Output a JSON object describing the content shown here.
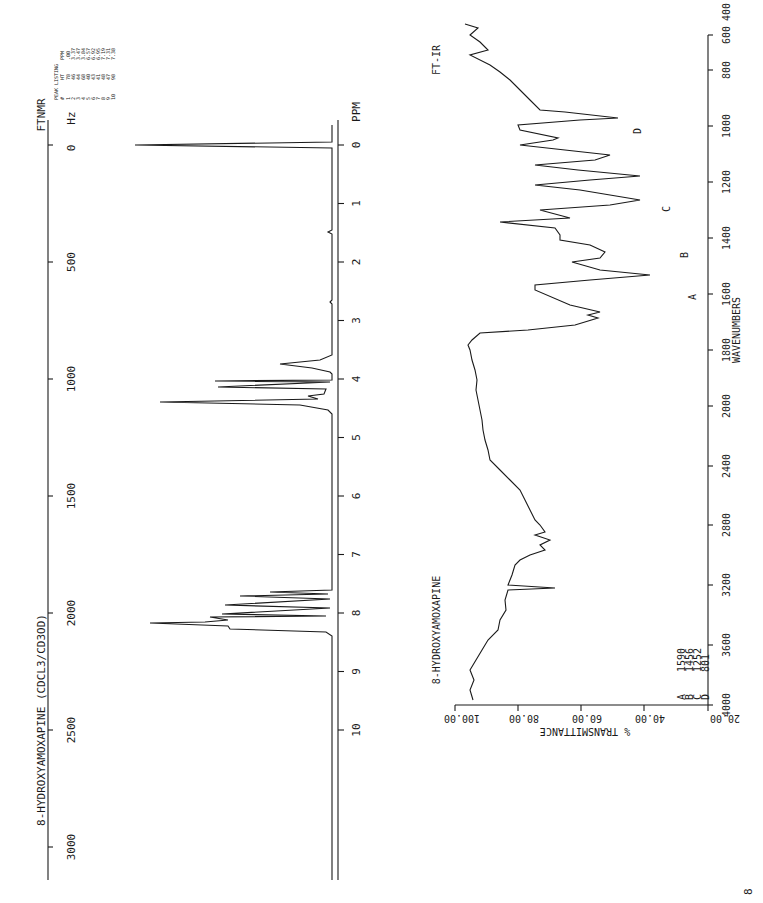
{
  "nmr": {
    "title": "8-HYDROXYAMOXAPINE (CDCL3/CD3OD)",
    "instrument": "FTNMR",
    "hz_unit": "Hz",
    "ppm_unit": "PPM",
    "hz_ticks": [
      "0",
      "500",
      "1000",
      "1500",
      "2000",
      "2500",
      "3000"
    ],
    "ppm_ticks": [
      "0",
      "1",
      "2",
      "3",
      "4",
      "5",
      "6",
      "7",
      "8",
      "9",
      "10"
    ],
    "peak_listing": {
      "title": "PEAK LISTING",
      "headers": [
        "#",
        "HT",
        "PPM"
      ],
      "rows": [
        [
          "1",
          "78",
          ".00"
        ],
        [
          "2",
          "46",
          "3.37"
        ],
        [
          "3",
          "44",
          "3.47"
        ],
        [
          "4",
          "68",
          "3.84"
        ],
        [
          "5",
          "40",
          "6.57"
        ],
        [
          "6",
          "43",
          "6.92"
        ],
        [
          "7",
          "41",
          "6.95"
        ],
        [
          "8",
          "48",
          "7.19"
        ],
        [
          "9",
          "47",
          "7.31"
        ],
        [
          "10",
          "98",
          "7.38"
        ]
      ]
    }
  },
  "ir": {
    "title": "8-HYDROXYAMOXAPINE",
    "instrument": "FT-IR",
    "x_label": "WAVENUMBERS",
    "y_label": "% TRANSMITTANCE",
    "x_ticks": [
      "4000",
      "3600",
      "3200",
      "2800",
      "2400",
      "2000",
      "1800",
      "1600",
      "1400",
      "1200",
      "1000",
      "800",
      "600",
      "400"
    ],
    "y_ticks": [
      "20.00",
      "40.00",
      "60.00",
      "80.00",
      "100.00"
    ],
    "peaks": [
      {
        "label": "A",
        "wavenumber": "1590"
      },
      {
        "label": "B",
        "wavenumber": "1456"
      },
      {
        "label": "C",
        "wavenumber": "1252"
      },
      {
        "label": "D",
        "wavenumber": "801"
      }
    ]
  },
  "page_mark": "8"
}
